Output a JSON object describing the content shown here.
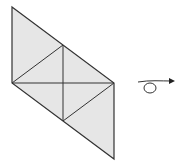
{
  "diagram": {
    "colors": {
      "fill": "#e6e6e6",
      "stroke": "#333333",
      "background": "#ffffff"
    },
    "vertices": {
      "A": [
        12,
        7
      ],
      "B": [
        12,
        83
      ],
      "C": [
        63,
        45
      ],
      "D": [
        63,
        121
      ],
      "E": [
        114,
        83
      ],
      "F": [
        114,
        159
      ]
    },
    "rotation_symbol": "curved-arrow-loop"
  }
}
